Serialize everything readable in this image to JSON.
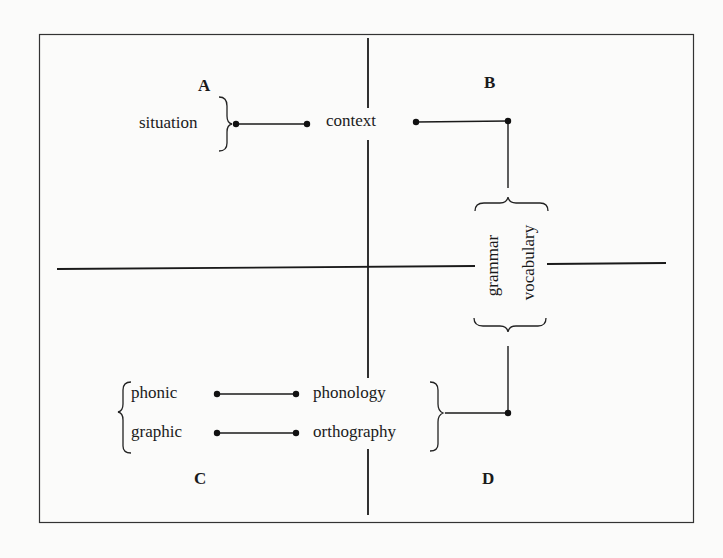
{
  "quadrants": {
    "a": "A",
    "b": "B",
    "c": "C",
    "d": "D"
  },
  "nodes": {
    "situation": "situation",
    "context": "context",
    "grammar": "grammar",
    "vocabulary": "vocabulary",
    "phonic": "phonic",
    "graphic": "graphic",
    "phonology": "phonology",
    "orthography": "orthography"
  },
  "connections": [
    {
      "from": "situation",
      "to": "context"
    },
    {
      "from": "context",
      "to": "grammar/vocabulary"
    },
    {
      "from": "grammar/vocabulary",
      "to": "phonology/orthography"
    },
    {
      "from": "phonic",
      "to": "phonology"
    },
    {
      "from": "graphic",
      "to": "orthography"
    }
  ],
  "colors": {
    "ink": "#1a1a1a",
    "paper": "#fbfbfa"
  }
}
